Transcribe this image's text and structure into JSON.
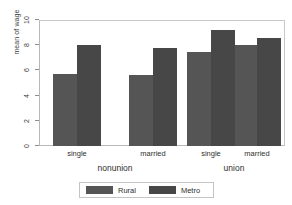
{
  "chart_data": {
    "type": "bar",
    "title": "",
    "subtitle": "",
    "xlabel": "",
    "ylabel": "mean of wage",
    "ylim": [
      0,
      10
    ],
    "yticks": [
      0,
      2,
      4,
      6,
      8,
      10
    ],
    "ytick_labels": [
      "0",
      "2",
      "4",
      "6",
      "8",
      "10"
    ],
    "grid": false,
    "legend_position": "bottom",
    "groups": [
      {
        "label": "nonunion",
        "categories": [
          "single",
          "married"
        ]
      },
      {
        "label": "union",
        "categories": [
          "single",
          "married"
        ]
      }
    ],
    "categories": [
      "nonunion / single",
      "nonunion / married",
      "union / single",
      "union / married"
    ],
    "series": [
      {
        "name": "Rural",
        "color": "#555555",
        "values": [
          5.7,
          5.6,
          7.5,
          8.0
        ]
      },
      {
        "name": "Metro",
        "color": "#474747",
        "values": [
          8.0,
          7.8,
          9.2,
          8.6
        ]
      }
    ]
  },
  "axis": {
    "y_title": "mean of wage",
    "y_ticks": [
      {
        "value": 10,
        "label": "10"
      },
      {
        "value": 8,
        "label": "8"
      },
      {
        "value": 6,
        "label": "6"
      },
      {
        "value": 4,
        "label": "4"
      },
      {
        "value": 2,
        "label": "2"
      },
      {
        "value": 0,
        "label": "0"
      }
    ],
    "x_tick_labels": [
      "single",
      "married",
      "single",
      "married"
    ],
    "x_group_labels": [
      "nonunion",
      "union"
    ]
  },
  "legend": {
    "entries": [
      {
        "label": "Rural",
        "color": "#555555"
      },
      {
        "label": "Metro",
        "color": "#474747"
      }
    ]
  },
  "colors": {
    "rural": "#555555",
    "metro": "#474747",
    "frame": "#b9b9b9",
    "text": "#2e2e2e",
    "background": "#ffffff"
  }
}
